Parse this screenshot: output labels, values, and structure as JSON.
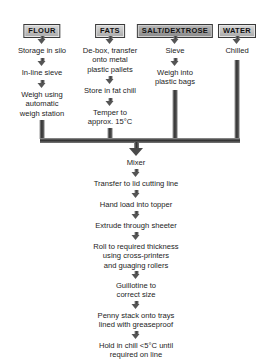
{
  "diagram": {
    "colors": {
      "background": "#ffffff",
      "text": "#1c1c1c",
      "rail_dark": "#2f2f2f",
      "rail_light": "#9a9a9a",
      "header_fill": "#bfbfbf",
      "header_fill_dark": "#9d9d9d",
      "header_border": "#3a3a3a"
    },
    "ingredient_columns": [
      {
        "header": "FLOUR",
        "shade": "light",
        "steps": [
          "Storage in silo",
          "In-line sieve",
          "Weigh using\nautomatic\nweigh station"
        ]
      },
      {
        "header": "FATS",
        "shade": "light",
        "steps": [
          "De-box, transfer\nonto metal\nplastic pallets",
          "Store in fat chill",
          "Temper to\napprox. 15°C"
        ]
      },
      {
        "header": "SALT/DEXTROSE",
        "shade": "dark",
        "steps": [
          "Sieve",
          "Weigh into\nplastic bags"
        ]
      },
      {
        "header": "WATER",
        "shade": "light",
        "steps": [
          "Chilled"
        ]
      }
    ],
    "main_steps": [
      "Mixer",
      "Transfer to lid cutting line",
      "Hand load into topper",
      "Extrude through sheeter",
      "Roll to required thickness\nusing cross-printers\nand guaging rollers",
      "Guillotine to\ncorrect size",
      "Penny stack onto trays\nlined with greaseproof",
      "Hold in chill <5°C until\nrequired on line"
    ]
  }
}
